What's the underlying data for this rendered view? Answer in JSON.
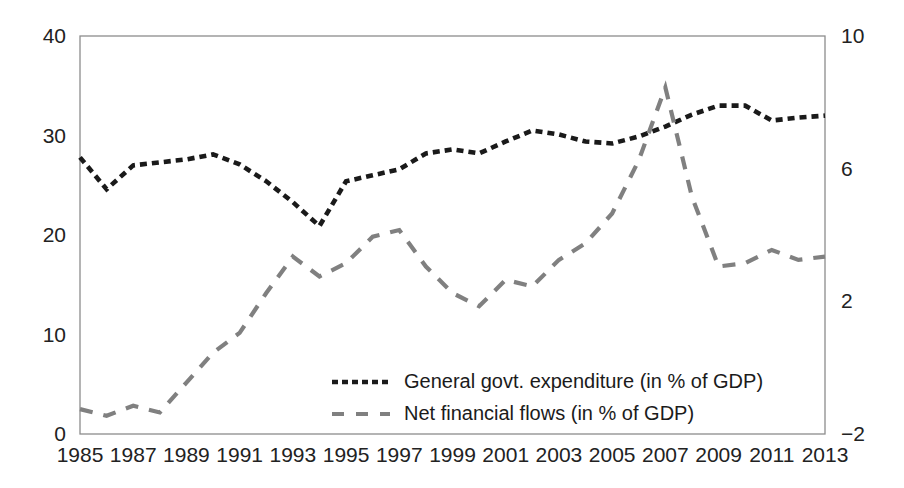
{
  "chart_data": {
    "type": "line",
    "title": "",
    "subtitle": "",
    "xlabel": "",
    "ylabel": "",
    "y2label": "",
    "grid": false,
    "legend_position": "inside-bottom-center",
    "x": [
      1985,
      1986,
      1987,
      1988,
      1989,
      1990,
      1991,
      1992,
      1993,
      1994,
      1995,
      1996,
      1997,
      1998,
      1999,
      2000,
      2001,
      2002,
      2003,
      2004,
      2005,
      2006,
      2007,
      2008,
      2009,
      2010,
      2011,
      2012,
      2013
    ],
    "xtick_labels": [
      "1985",
      "1987",
      "1989",
      "1991",
      "1993",
      "1995",
      "1997",
      "1999",
      "2001",
      "2003",
      "2005",
      "2007",
      "2009",
      "2011",
      "2013"
    ],
    "xtick_values": [
      1985,
      1987,
      1989,
      1991,
      1993,
      1995,
      1997,
      1999,
      2001,
      2003,
      2005,
      2007,
      2009,
      2011,
      2013
    ],
    "xlim": [
      1985,
      2013
    ],
    "ylim": [
      0,
      40
    ],
    "ytick_labels": [
      "0",
      "10",
      "20",
      "30",
      "40"
    ],
    "ytick_values": [
      0,
      10,
      20,
      30,
      40
    ],
    "y2lim": [
      -2,
      10
    ],
    "y2tick_labels": [
      "-2",
      "2",
      "6",
      "10"
    ],
    "y2tick_values": [
      -2,
      2,
      6,
      10
    ],
    "series": [
      {
        "name": "General govt. expenditure (in % of GDP)",
        "axis": "left",
        "color": "#1a1a1a",
        "dash": "short",
        "values": [
          27.8,
          24.6,
          27.0,
          27.3,
          27.6,
          28.1,
          27.1,
          25.4,
          23.3,
          20.9,
          25.4,
          26.0,
          26.6,
          28.2,
          28.6,
          28.2,
          29.4,
          30.5,
          30.1,
          29.4,
          29.2,
          29.9,
          30.9,
          32.1,
          33.0,
          33.0,
          31.5,
          31.8,
          32.0
        ]
      },
      {
        "name": "Net financial flows (in % of GDP)",
        "axis": "right",
        "color": "#808080",
        "dash": "long",
        "values": [
          -1.25,
          -1.45,
          -1.15,
          -1.35,
          -0.45,
          0.45,
          1.05,
          2.25,
          3.35,
          2.75,
          3.15,
          3.95,
          4.15,
          3.05,
          2.25,
          1.85,
          2.65,
          2.45,
          3.25,
          3.75,
          4.65,
          6.25,
          8.45,
          5.15,
          3.05,
          3.15,
          3.55,
          3.25,
          3.35
        ]
      }
    ]
  },
  "legend": {
    "items": [
      {
        "label": "General govt. expenditure (in % of GDP)",
        "color": "#1a1a1a",
        "dash": "6,4"
      },
      {
        "label": "Net financial flows (in % of GDP)",
        "color": "#808080",
        "dash": "12,12"
      }
    ]
  },
  "colors": {
    "frame": "#8d8d8d",
    "text": "#222222",
    "background": "#ffffff",
    "series_dark": "#1a1a1a",
    "series_gray": "#808080"
  }
}
